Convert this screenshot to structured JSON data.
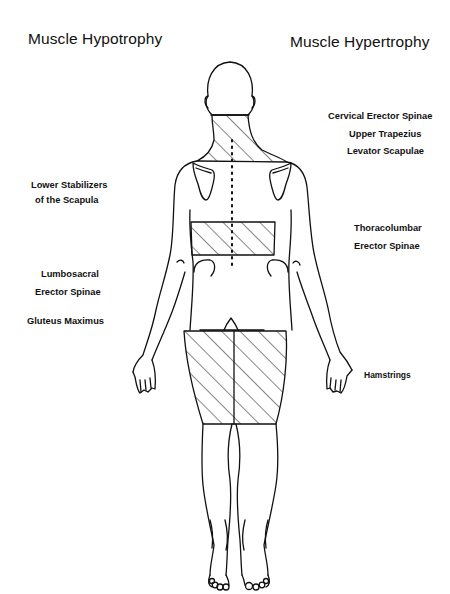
{
  "titles": {
    "left": "Muscle Hypotrophy",
    "right": "Muscle Hypertrophy"
  },
  "hypotrophy_labels": [
    {
      "lines": [
        "Lower Stabilizers",
        "of the Scapula"
      ]
    },
    {
      "lines": [
        "Lumbosacral",
        "Erector Spinae"
      ]
    },
    {
      "lines": [
        "Gluteus  Maximus"
      ]
    }
  ],
  "hypertrophy_labels": [
    {
      "lines": [
        "Cervical Erector Spinae",
        "Upper Trapezius",
        "Levator Scapulae"
      ]
    },
    {
      "lines": [
        "Thoracolumbar",
        "Erector Spinae"
      ]
    },
    {
      "lines": [
        "Hamstrings"
      ]
    }
  ],
  "figure": {
    "view": "posterior body outline",
    "hatched_regions": [
      "neck-upper-trapezius",
      "thoracolumbar",
      "hamstrings"
    ],
    "line_color": "#111111"
  }
}
